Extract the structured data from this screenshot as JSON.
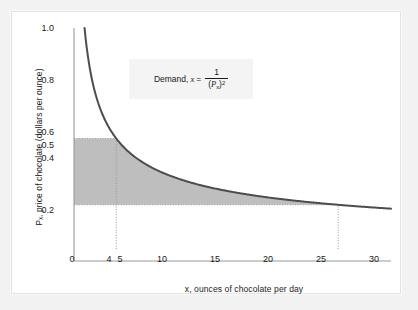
{
  "figure": {
    "background_color": "#f2f2f2",
    "card_color": "#ffffff"
  },
  "annotation": {
    "equation_lead": "Demand, ",
    "equation_var": "x",
    "equation_equals": " = ",
    "numerator": "1",
    "denominator_open": "(",
    "denominator_var": "P",
    "denominator_sub": "x",
    "denominator_close": ")",
    "denominator_exp": "2"
  },
  "chart_data": {
    "type": "line",
    "title": "",
    "xlabel": "x, ounces of chocolate per day",
    "ylabel": "Pₓ, price of chocolate (dollars per ounce)",
    "xlim": [
      0,
      30
    ],
    "ylim": [
      0.0,
      1.0
    ],
    "grid": false,
    "legend": "none",
    "curve_label": "Demand, x = 1/(Pₓ)²",
    "curve_color": "#4d4d4d",
    "shade_color": "#b3b3b3",
    "dotted_color": "#999999",
    "axis_color": "#999999",
    "xticks": [
      0,
      4,
      5,
      10,
      15,
      20,
      25,
      30
    ],
    "xtick_labels": [
      "0",
      "4",
      "5",
      "10",
      "15",
      "20",
      "25",
      "30"
    ],
    "yticks": [
      0.2,
      0.4,
      0.5,
      0.6,
      0.8,
      1.0
    ],
    "ytick_labels": [
      "0.2",
      "0.4",
      "0.5",
      "0.6",
      "0.8",
      "1.0"
    ],
    "series": [
      {
        "name": "Demand",
        "formula": "P = 1 / sqrt(x)",
        "x": [
          1.0,
          1.2,
          1.5,
          2.0,
          2.5,
          3.0,
          3.5,
          4.0,
          5.0,
          6.0,
          7.0,
          8.0,
          9.0,
          10.0,
          12.0,
          14.0,
          16.0,
          18.0,
          20.0,
          22.0,
          25.0,
          27.0,
          30.0
        ],
        "y": [
          1.0,
          0.913,
          0.816,
          0.707,
          0.632,
          0.577,
          0.535,
          0.5,
          0.447,
          0.408,
          0.378,
          0.354,
          0.333,
          0.316,
          0.289,
          0.267,
          0.25,
          0.236,
          0.224,
          0.213,
          0.2,
          0.192,
          0.183
        ]
      }
    ],
    "reference_lines": [
      {
        "name": "price-0.5-line",
        "orientation": "horizontal",
        "value": 0.5,
        "from_x": 0,
        "to_x": 4
      },
      {
        "name": "price-0.2-line",
        "orientation": "horizontal",
        "value": 0.2,
        "from_x": 0,
        "to_x": 25
      },
      {
        "name": "quantity-4-line",
        "orientation": "vertical",
        "value": 4,
        "from_y": 0,
        "to_y": 0.5
      },
      {
        "name": "quantity-25-line",
        "orientation": "vertical",
        "value": 25,
        "from_y": 0,
        "to_y": 0.2
      }
    ],
    "shaded_region": {
      "name": "consumer-surplus-area",
      "description": "Area under demand curve above price 0.2, from x = 0 to x = 25",
      "upper_bound": "demand curve (capped at 0.5 for x < 4)",
      "lower_bound": 0.2,
      "x_range": [
        0,
        25
      ]
    }
  }
}
